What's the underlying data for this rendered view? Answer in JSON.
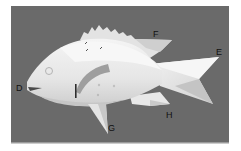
{
  "image": {
    "subject": "paper model of a fish on gray background",
    "background_color": "#6a6a6a",
    "frame_color": "#ffffff",
    "model_color": "#ececec",
    "shadow_color": "#b8b8b8"
  },
  "labels": [
    {
      "id": "D",
      "text": "D",
      "points_to": "mouth"
    },
    {
      "id": "E",
      "text": "E",
      "points_to": "tail fin"
    },
    {
      "id": "F",
      "text": "F",
      "points_to": "dorsal fin"
    },
    {
      "id": "G",
      "text": "G",
      "points_to": "pelvic fin"
    },
    {
      "id": "H",
      "text": "H",
      "points_to": "anal fin"
    }
  ]
}
